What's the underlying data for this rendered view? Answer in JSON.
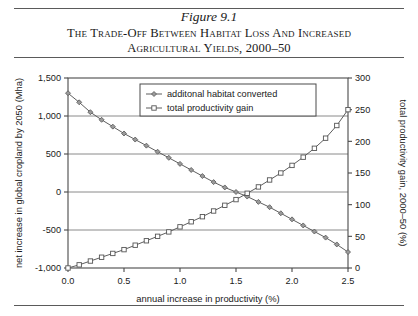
{
  "figure": {
    "number": "Figure 9.1",
    "title": "The Trade-Off Between Habitat Loss and Increased Agricultural Yields, 2000–50"
  },
  "chart_data": {
    "type": "line",
    "title": "The Trade-Off Between Habitat Loss and Increased Agricultural Yields, 2000–50",
    "xlabel": "annual increase in productivity (%)",
    "ylabel": "net increase in global cropland by 2050 (Mha)",
    "y2label": "total productivity gain, 2000–50 (%)",
    "xlim": [
      0.0,
      2.5
    ],
    "ylim": [
      -1000,
      1500
    ],
    "y2lim": [
      0,
      300
    ],
    "xticks": [
      "0.0",
      "0.5",
      "1.0",
      "1.5",
      "2.0",
      "2.5"
    ],
    "xtick_values": [
      0.0,
      0.5,
      1.0,
      1.5,
      2.0,
      2.5
    ],
    "yticks": [
      "-1,000",
      "-500",
      "0",
      "500",
      "1,000",
      "1,500"
    ],
    "ytick_values": [
      -1000,
      -500,
      0,
      500,
      1000,
      1500
    ],
    "y2ticks": [
      "0",
      "50",
      "100",
      "150",
      "200",
      "250",
      "300"
    ],
    "y2tick_values": [
      0,
      50,
      100,
      150,
      200,
      250,
      300
    ],
    "grid": "horizontal",
    "legend_position": "upper-center",
    "x": [
      0.0,
      0.1,
      0.2,
      0.3,
      0.4,
      0.5,
      0.6,
      0.7,
      0.8,
      0.9,
      1.0,
      1.1,
      1.2,
      1.3,
      1.4,
      1.5,
      1.6,
      1.7,
      1.8,
      1.9,
      2.0,
      2.1,
      2.2,
      2.3,
      2.4,
      2.5
    ],
    "series": [
      {
        "name": "additonal habitat converted",
        "axis": "left",
        "marker": "diamond-filled",
        "values": [
          1300,
          1180,
          1050,
          950,
          860,
          770,
          690,
          610,
          530,
          450,
          370,
          290,
          210,
          130,
          60,
          0,
          -60,
          -130,
          -200,
          -280,
          -360,
          -440,
          -520,
          -600,
          -690,
          -790
        ]
      },
      {
        "name": "total productivity gain",
        "axis": "right",
        "marker": "square-open",
        "values": [
          0,
          5,
          11,
          17,
          23,
          29,
          36,
          43,
          50,
          57,
          65,
          73,
          81,
          90,
          99,
          108,
          118,
          128,
          139,
          150,
          162,
          175,
          189,
          205,
          225,
          250
        ]
      }
    ],
    "colors": {
      "line": "#555555",
      "frame": "#4a4a4a",
      "grid": "#7d7d7d",
      "background": "#ffffff"
    }
  }
}
